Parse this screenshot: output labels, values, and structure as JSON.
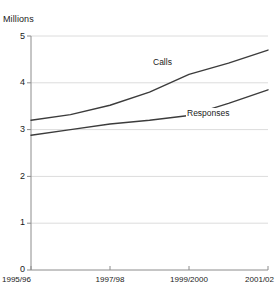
{
  "chart_data": {
    "type": "line",
    "title": "",
    "subtitle": "",
    "units_label": "Millions",
    "xlabel": "",
    "ylabel": "Millions",
    "ylim": [
      0,
      5
    ],
    "yticks": [
      0,
      1,
      2,
      3,
      4,
      5
    ],
    "ytick_labels": [
      "0",
      "1",
      "2",
      "3",
      "4",
      "5"
    ],
    "grid": true,
    "grid_axis": "y",
    "legend": "inline-series-labels",
    "x": [
      "1995/96",
      "1996/97",
      "1997/98",
      "1998/99",
      "1999/2000",
      "2000/01",
      "2001/02"
    ],
    "xtick_labels_shown": [
      "1995/96",
      "1997/98",
      "1999/2000",
      "2001/02"
    ],
    "xtick_label_indices": [
      0,
      2,
      4,
      6
    ],
    "series": [
      {
        "name": "Calls",
        "values": [
          3.2,
          3.32,
          3.52,
          3.8,
          4.18,
          4.42,
          4.7
        ],
        "color": "#3c3c3c"
      },
      {
        "name": "Responses",
        "values": [
          2.88,
          3.0,
          3.12,
          3.2,
          3.3,
          3.56,
          3.85
        ],
        "color": "#3c3c3c"
      }
    ],
    "annotations": [
      {
        "text": "Calls",
        "series": "Calls"
      },
      {
        "text": "Responses",
        "series": "Responses"
      }
    ],
    "colors": {
      "background": "#ffffff",
      "axis": "#808080",
      "gridline": "#dcdcdc",
      "line": "#3c3c3c",
      "text": "#1a1a1a"
    }
  },
  "axis": {
    "y_ticks": [
      {
        "label": "5"
      },
      {
        "label": "4"
      },
      {
        "label": "3"
      },
      {
        "label": "2"
      },
      {
        "label": "1"
      },
      {
        "label": "0"
      }
    ],
    "x_ticks": [
      {
        "label": "1995/96"
      },
      {
        "label": "1997/98"
      },
      {
        "label": "1999/2000"
      },
      {
        "label": "2001/02"
      }
    ]
  },
  "labels": {
    "units": "Millions",
    "calls": "Calls",
    "responses": "Responses"
  },
  "artifacts": {
    "top": "",
    "bottom": ""
  }
}
